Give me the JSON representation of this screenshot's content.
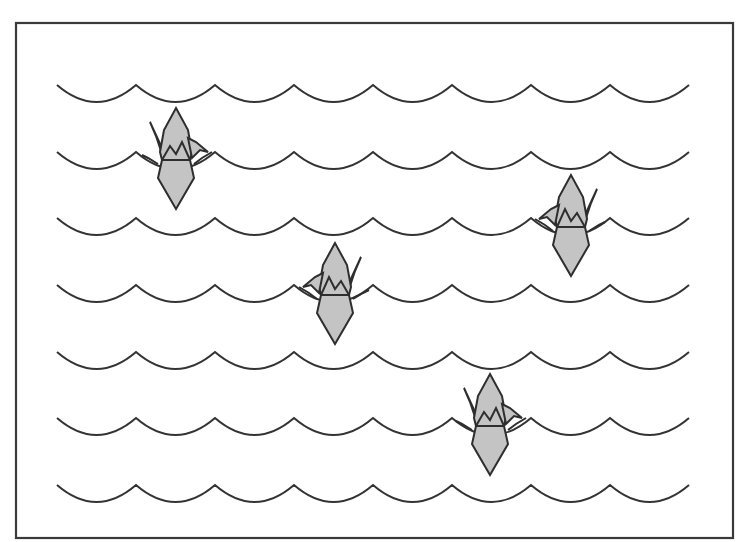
{
  "illustration": {
    "title": "Origami cranes floating on waves",
    "colors": {
      "background": "#ffffff",
      "line": "#333333",
      "crane_fill": "#c4c4c4"
    },
    "frame": {
      "x": 16,
      "y": 23,
      "width": 717,
      "height": 515
    },
    "waves": {
      "rows_y": [
        85,
        152,
        218,
        285,
        352,
        418,
        485
      ],
      "start_x": 57,
      "end_x": 690,
      "scallop_width": 79,
      "depth": 17
    },
    "cranes": [
      {
        "id": "crane-1",
        "cx": 176,
        "top": 108,
        "bottom": 209,
        "head_side": "right"
      },
      {
        "id": "crane-2",
        "cx": 571,
        "top": 175,
        "bottom": 276,
        "head_side": "left"
      },
      {
        "id": "crane-3",
        "cx": 335,
        "top": 243,
        "bottom": 344,
        "head_side": "left"
      },
      {
        "id": "crane-4",
        "cx": 490,
        "top": 374,
        "bottom": 475,
        "head_side": "right"
      }
    ]
  }
}
